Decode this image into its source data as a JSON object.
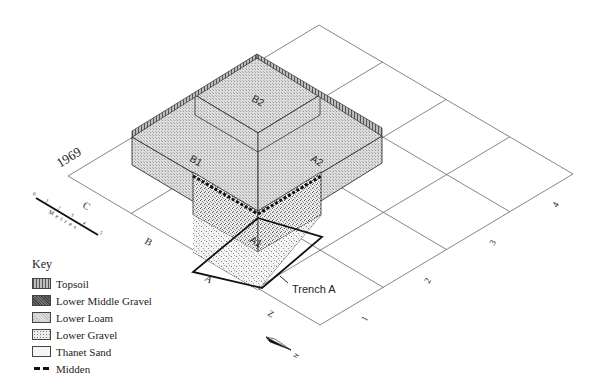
{
  "figure": {
    "year_label": "1969",
    "row_labels": [
      "C",
      "B",
      "A",
      "Z"
    ],
    "column_labels": [
      "1",
      "2",
      "3",
      "4"
    ],
    "box_labels": {
      "b2": "B2",
      "b1": "B1",
      "a2": "A2",
      "a1": "A1"
    },
    "trench_label": "Trench A",
    "north_label": "N",
    "scale_bar": {
      "unit_label": "Metres",
      "ticks": [
        "0",
        "1",
        "2",
        "3",
        "4",
        "5"
      ]
    }
  },
  "key": {
    "title": "Key",
    "items": [
      {
        "label": "Topsoil",
        "pattern": "topsoil"
      },
      {
        "label": "Lower Middle Gravel",
        "pattern": "lower-middle-gravel"
      },
      {
        "label": "Lower Loam",
        "pattern": "lower-loam"
      },
      {
        "label": "Lower Gravel",
        "pattern": "lower-gravel"
      },
      {
        "label": "Thanet Sand",
        "pattern": "thanet-sand"
      },
      {
        "label": "Midden",
        "pattern": "midden"
      }
    ]
  },
  "colors": {
    "line": "#555555",
    "loam": "#d6d6d6",
    "gravel": "#e4e4e4",
    "sand": "#f3f3f3",
    "topsoil": "#9a9a9a",
    "midden": "#111111"
  }
}
